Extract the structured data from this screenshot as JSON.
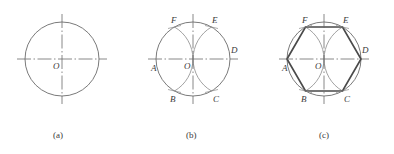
{
  "figure": {
    "background": "#ffffff",
    "colors": {
      "thin_line": "#6b6b6b",
      "arc_line": "#8a8a8a",
      "center_line": "#6b6b6b",
      "heavy_line": "#4a4a4a",
      "text": "#3a3a3a"
    },
    "panels": [
      {
        "key": "a",
        "caption": "(a)",
        "caption_x": 62,
        "caption_y": 134,
        "center": {
          "x": 62,
          "y": 59
        },
        "radius": 37,
        "labels": [
          {
            "text": "O",
            "x": 53,
            "y": 62
          }
        ]
      },
      {
        "key": "b",
        "caption": "(b)",
        "caption_x": 195,
        "caption_y": 134,
        "center": {
          "x": 193,
          "y": 59
        },
        "radius": 37,
        "labels": [
          {
            "text": "O",
            "x": 184,
            "y": 62
          },
          {
            "text": "A",
            "x": 151,
            "y": 64
          },
          {
            "text": "D",
            "x": 231,
            "y": 48
          },
          {
            "text": "B",
            "x": 170,
            "y": 102
          },
          {
            "text": "C",
            "x": 213,
            "y": 102
          },
          {
            "text": "F",
            "x": 171,
            "y": 19
          },
          {
            "text": "E",
            "x": 212,
            "y": 19
          }
        ]
      },
      {
        "key": "c",
        "caption": "(c)",
        "caption_x": 328,
        "caption_y": 134,
        "center": {
          "x": 324,
          "y": 59
        },
        "radius": 37,
        "labels": [
          {
            "text": "O",
            "x": 315,
            "y": 62
          },
          {
            "text": "A",
            "x": 282,
            "y": 64
          },
          {
            "text": "D",
            "x": 362,
            "y": 48
          },
          {
            "text": "B",
            "x": 301,
            "y": 102
          },
          {
            "text": "C",
            "x": 344,
            "y": 102
          },
          {
            "text": "F",
            "x": 302,
            "y": 19
          },
          {
            "text": "E",
            "x": 343,
            "y": 19
          }
        ]
      }
    ],
    "vertex_names": [
      "A",
      "B",
      "C",
      "D",
      "E",
      "F"
    ],
    "center_label": "O"
  }
}
